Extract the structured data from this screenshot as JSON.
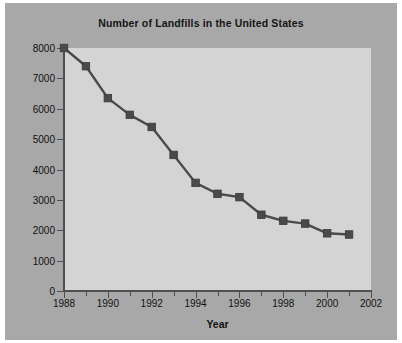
{
  "chart_data": {
    "type": "line",
    "title": "Number of Landfills in the United States",
    "xlabel": "Year",
    "ylabel": "",
    "xlim": [
      1988,
      2002
    ],
    "ylim": [
      0,
      8000
    ],
    "grid": false,
    "legend": null,
    "marker": "square",
    "series_color": "#4a4a4a",
    "plot_bg_color": "#d4d4d4",
    "figure_bg_color": "#a8a8a8",
    "x": [
      1988,
      1989,
      1990,
      1991,
      1992,
      1993,
      1994,
      1995,
      1996,
      1997,
      1998,
      1999,
      2000,
      2001
    ],
    "values": [
      8000,
      7400,
      6350,
      5800,
      5400,
      4480,
      3560,
      3200,
      3090,
      2510,
      2310,
      2220,
      1900,
      1860
    ],
    "series": [
      {
        "name": "Number of Landfills",
        "values": [
          8000,
          7400,
          6350,
          5800,
          5400,
          4480,
          3560,
          3200,
          3090,
          2510,
          2310,
          2220,
          1900,
          1860
        ]
      }
    ],
    "ytick_labels": [
      "0",
      "1000",
      "2000",
      "3000",
      "4000",
      "5000",
      "6000",
      "7000",
      "8000"
    ],
    "ytick_values": [
      0,
      1000,
      2000,
      3000,
      4000,
      5000,
      6000,
      7000,
      8000
    ],
    "xtick_labels": [
      "1988",
      "1990",
      "1992",
      "1994",
      "1996",
      "1998",
      "2000",
      "2002"
    ],
    "xtick_values": [
      1988,
      1990,
      1992,
      1994,
      1996,
      1998,
      2000,
      2002
    ],
    "xminor_values": [
      1989,
      1991,
      1993,
      1995,
      1997,
      1999,
      2001
    ]
  }
}
